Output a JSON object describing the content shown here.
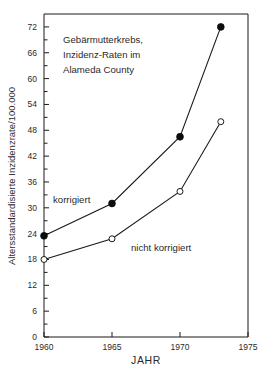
{
  "chart_data": {
    "type": "line",
    "title": "Gebärmutterkrebs, Inzidenz-Raten im Alameda County",
    "title_lines": [
      "Gebärmutterkrebs,",
      "Inzidenz-Raten im",
      "Alameda County"
    ],
    "xlabel": "JAHR",
    "ylabel": "Altersstandardisierte Inzidenzrate/100.000",
    "x": [
      1960,
      1965,
      1970,
      1973
    ],
    "xlim": [
      1960,
      1975
    ],
    "ylim": [
      0,
      75
    ],
    "xticks": [
      1960,
      1965,
      1970,
      1975
    ],
    "xtick_labels": [
      "1960",
      "1965",
      "1970",
      "1975"
    ],
    "yticks": [
      0,
      6,
      12,
      18,
      24,
      30,
      36,
      42,
      48,
      54,
      60,
      66,
      72
    ],
    "ytick_labels": [
      "0",
      "6",
      "12",
      "18",
      "24",
      "30",
      "36",
      "42",
      "48",
      "54",
      "60",
      "66",
      "72"
    ],
    "grid": false,
    "legend_position": "inline-annotations",
    "series": [
      {
        "name": "korrigiert",
        "marker": "filled-circle",
        "color": "#0d0d0d",
        "values": [
          23.5,
          31.0,
          46.5,
          72.0
        ]
      },
      {
        "name": "nicht korrigiert",
        "marker": "open-circle",
        "color": "#1a1a1a",
        "values": [
          18.0,
          22.8,
          33.8,
          50.0
        ]
      }
    ],
    "annotations": [
      {
        "text": "korrigiert",
        "x": 1963.2,
        "y": 34.5
      },
      {
        "text": "nicht korrigiert",
        "x": 1967.0,
        "y": 22.2
      }
    ]
  },
  "colors": {
    "background": "#ffffff",
    "axis": "#1a1a1a",
    "text": "#2a2a2a"
  }
}
